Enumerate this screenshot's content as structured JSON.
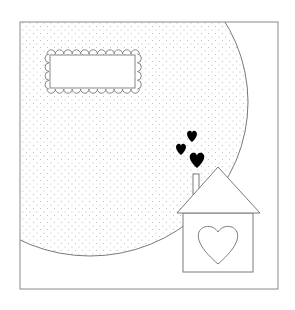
{
  "card": {
    "description": "Scrapbook card template with dotted circle, scalloped label and house with hearts",
    "colors": {
      "background": "#ffffff",
      "line": "#7a7a7a",
      "dots": "#b5b5b5",
      "hearts": "#000000"
    },
    "label_text": "",
    "elements": [
      "frame",
      "dotted-circle",
      "scalloped-label",
      "hearts",
      "house",
      "house-heart"
    ]
  }
}
